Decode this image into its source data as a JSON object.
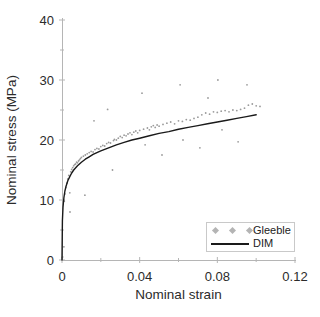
{
  "figure": {
    "background": "#ffffff",
    "axis_color": "#b5b5b5",
    "tick_label_color": "#2b2b2b",
    "scatter_color": "#9b9b9b",
    "line_color": "#1a1a1a",
    "legend_marker_color": "#b4b4b4"
  },
  "legend": {
    "entries": [
      {
        "label": "Gleeble",
        "type": "scatter",
        "marker": "diamond",
        "color": "#b4b4b4"
      },
      {
        "label": "DIM",
        "type": "line",
        "color": "#1a1a1a"
      }
    ],
    "position": "lower right"
  },
  "chart_data": {
    "type": "scatter",
    "title": "",
    "xlabel": "Nominal strain",
    "ylabel": "Nominal stress (MPa)",
    "xlim": [
      0,
      0.12
    ],
    "ylim": [
      0,
      40
    ],
    "grid": false,
    "x_major_ticks": [
      {
        "v": 0,
        "label": "0"
      },
      {
        "v": 0.04,
        "label": "0.04"
      },
      {
        "v": 0.08,
        "label": "0.08"
      },
      {
        "v": 0.12,
        "label": "0.12"
      }
    ],
    "x_minor_ticks": [
      0.02,
      0.06,
      0.1
    ],
    "y_major_ticks": [
      {
        "v": 0,
        "label": "0"
      },
      {
        "v": 10,
        "label": "10"
      },
      {
        "v": 20,
        "label": "20"
      },
      {
        "v": 30,
        "label": "30"
      },
      {
        "v": 40,
        "label": "40"
      }
    ],
    "y_minor_ticks": [
      5,
      15,
      25,
      35
    ],
    "series": [
      {
        "name": "Gleeble",
        "type": "scatter",
        "points": [
          [
            0.0003,
            0.5
          ],
          [
            0.001,
            2.2
          ],
          [
            0.0012,
            9.8
          ],
          [
            0.0015,
            11.0
          ],
          [
            0.002,
            12.1
          ],
          [
            0.0025,
            12.8
          ],
          [
            0.003,
            13.5
          ],
          [
            0.0035,
            14.1
          ],
          [
            0.004,
            11.2
          ],
          [
            0.0041,
            8.0
          ],
          [
            0.0045,
            14.7
          ],
          [
            0.005,
            15.1
          ],
          [
            0.0055,
            15.4
          ],
          [
            0.006,
            15.7
          ],
          [
            0.0065,
            15.9
          ],
          [
            0.007,
            16.0
          ],
          [
            0.0075,
            16.3
          ],
          [
            0.008,
            16.2
          ],
          [
            0.0085,
            16.5
          ],
          [
            0.009,
            16.7
          ],
          [
            0.0095,
            16.9
          ],
          [
            0.01,
            17.1
          ],
          [
            0.011,
            17.3
          ],
          [
            0.0118,
            10.8
          ],
          [
            0.012,
            17.5
          ],
          [
            0.013,
            17.7
          ],
          [
            0.014,
            17.9
          ],
          [
            0.015,
            18.1
          ],
          [
            0.016,
            18.0
          ],
          [
            0.0165,
            23.2
          ],
          [
            0.017,
            18.4
          ],
          [
            0.018,
            18.6
          ],
          [
            0.019,
            18.5
          ],
          [
            0.02,
            18.9
          ],
          [
            0.021,
            19.1
          ],
          [
            0.022,
            19.0
          ],
          [
            0.023,
            19.4
          ],
          [
            0.0235,
            25.1
          ],
          [
            0.024,
            19.6
          ],
          [
            0.025,
            19.5
          ],
          [
            0.026,
            15.0
          ],
          [
            0.0265,
            19.9
          ],
          [
            0.027,
            20.1
          ],
          [
            0.028,
            20.0
          ],
          [
            0.029,
            20.3
          ],
          [
            0.03,
            20.6
          ],
          [
            0.031,
            20.4
          ],
          [
            0.032,
            20.8
          ],
          [
            0.033,
            20.7
          ],
          [
            0.034,
            21.0
          ],
          [
            0.035,
            21.2
          ],
          [
            0.036,
            20.9
          ],
          [
            0.037,
            21.3
          ],
          [
            0.038,
            21.5
          ],
          [
            0.039,
            21.2
          ],
          [
            0.04,
            21.6
          ],
          [
            0.0412,
            27.8
          ],
          [
            0.042,
            21.8
          ],
          [
            0.0428,
            19.2
          ],
          [
            0.044,
            22.0
          ],
          [
            0.045,
            21.7
          ],
          [
            0.046,
            22.2
          ],
          [
            0.047,
            22.4
          ],
          [
            0.048,
            22.1
          ],
          [
            0.049,
            22.5
          ],
          [
            0.05,
            22.3
          ],
          [
            0.0515,
            17.5
          ],
          [
            0.052,
            22.6
          ],
          [
            0.054,
            22.8
          ],
          [
            0.056,
            23.0
          ],
          [
            0.058,
            22.7
          ],
          [
            0.06,
            23.2
          ],
          [
            0.0608,
            29.2
          ],
          [
            0.062,
            23.1
          ],
          [
            0.0623,
            20.0
          ],
          [
            0.064,
            23.4
          ],
          [
            0.066,
            23.3
          ],
          [
            0.068,
            23.6
          ],
          [
            0.07,
            23.8
          ],
          [
            0.071,
            18.7
          ],
          [
            0.072,
            24.2
          ],
          [
            0.074,
            24.5
          ],
          [
            0.0752,
            27.0
          ],
          [
            0.076,
            24.3
          ],
          [
            0.078,
            24.7
          ],
          [
            0.08,
            24.6
          ],
          [
            0.0803,
            30.0
          ],
          [
            0.082,
            24.8
          ],
          [
            0.0824,
            21.7
          ],
          [
            0.084,
            24.9
          ],
          [
            0.086,
            24.7
          ],
          [
            0.088,
            25.0
          ],
          [
            0.09,
            24.9
          ],
          [
            0.0907,
            19.7
          ],
          [
            0.092,
            25.1
          ],
          [
            0.094,
            25.3
          ],
          [
            0.0953,
            29.2
          ],
          [
            0.096,
            25.8
          ],
          [
            0.098,
            26.0
          ],
          [
            0.1,
            25.7
          ],
          [
            0.102,
            25.6
          ]
        ]
      },
      {
        "name": "DIM",
        "type": "line",
        "points": [
          [
            0,
            0
          ],
          [
            0.0002,
            6.5
          ],
          [
            0.0005,
            8.8
          ],
          [
            0.001,
            10.4
          ],
          [
            0.0015,
            11.5
          ],
          [
            0.002,
            12.2
          ],
          [
            0.003,
            13.2
          ],
          [
            0.004,
            13.9
          ],
          [
            0.005,
            14.5
          ],
          [
            0.006,
            15.0
          ],
          [
            0.008,
            15.7
          ],
          [
            0.01,
            16.3
          ],
          [
            0.012,
            16.8
          ],
          [
            0.014,
            17.2
          ],
          [
            0.016,
            17.6
          ],
          [
            0.018,
            17.9
          ],
          [
            0.02,
            18.2
          ],
          [
            0.024,
            18.7
          ],
          [
            0.028,
            19.2
          ],
          [
            0.032,
            19.6
          ],
          [
            0.036,
            20.0
          ],
          [
            0.04,
            20.3
          ],
          [
            0.045,
            20.7
          ],
          [
            0.05,
            21.1
          ],
          [
            0.055,
            21.4
          ],
          [
            0.06,
            21.8
          ],
          [
            0.065,
            22.1
          ],
          [
            0.07,
            22.4
          ],
          [
            0.075,
            22.7
          ],
          [
            0.08,
            23.0
          ],
          [
            0.085,
            23.3
          ],
          [
            0.09,
            23.6
          ],
          [
            0.095,
            23.9
          ],
          [
            0.1,
            24.2
          ]
        ]
      }
    ],
    "legend_position": "lower right"
  }
}
